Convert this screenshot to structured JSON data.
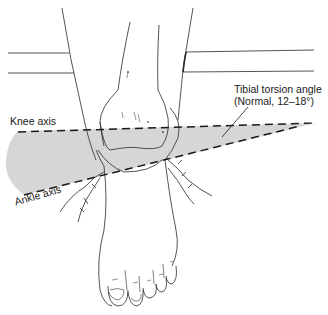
{
  "figure": {
    "labels": {
      "tibial_torsion_angle": "Tibial torsion angle",
      "normal_range": "(Normal, 12–18°)",
      "knee_axis": "Knee axis",
      "ankle_axis": "Ankle axis"
    },
    "colors": {
      "line": "#2a2a2a",
      "wedge_fill": "#d6d6d6",
      "background": "#ffffff"
    }
  }
}
